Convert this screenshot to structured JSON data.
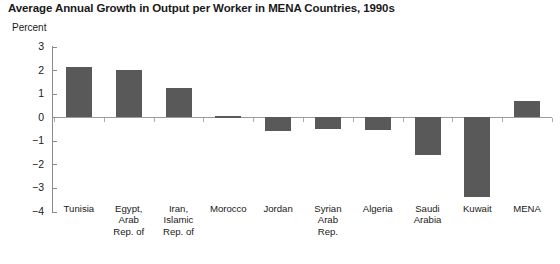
{
  "chart_data": {
    "type": "bar",
    "title": "Average Annual Growth in Output per Worker in MENA Countries, 1990s",
    "xlabel": "",
    "ylabel": "Percent",
    "ylim": [
      -4,
      3
    ],
    "yticks": [
      "3",
      "2",
      "1",
      "0",
      "−1",
      "−2",
      "−3",
      "−4"
    ],
    "ytick_values": [
      3,
      2,
      1,
      0,
      -1,
      -2,
      -3,
      -4
    ],
    "grid": false,
    "legend": "none",
    "bar_color": "#595959",
    "axis_color": "#8a8a8a",
    "categories": [
      "Tunisia",
      "Egypt, Arab Rep. of",
      "Iran, Islamic Rep. of",
      "Morocco",
      "Jordan",
      "Syrian Arab Rep.",
      "Algeria",
      "Saudi Arabia",
      "Kuwait",
      "MENA"
    ],
    "category_lines": [
      [
        "Tunisia"
      ],
      [
        "Egypt,",
        "Arab",
        "Rep. of"
      ],
      [
        "Iran,",
        "Islamic",
        "Rep. of"
      ],
      [
        "Morocco"
      ],
      [
        "Jordan"
      ],
      [
        "Syrian",
        "Arab",
        "Rep."
      ],
      [
        "Algeria"
      ],
      [
        "Saudi",
        "Arabia"
      ],
      [
        "Kuwait"
      ],
      [
        "MENA"
      ]
    ],
    "values": [
      2.15,
      2.0,
      1.25,
      0.07,
      -0.6,
      -0.5,
      -0.55,
      -1.6,
      -3.4,
      0.7
    ]
  }
}
